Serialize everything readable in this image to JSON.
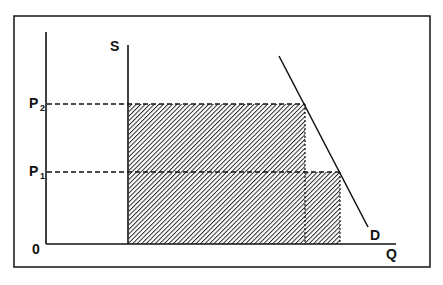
{
  "diagram": {
    "type": "supply-demand",
    "labels": {
      "supply": "S",
      "demand": "D",
      "quantity_axis": "Q",
      "origin": "0",
      "price_high": "P",
      "price_high_sub": "2",
      "price_low": "P",
      "price_low_sub": "1"
    },
    "colors": {
      "line": "#111111",
      "hatch": "#222222",
      "background": "#ffffff"
    }
  }
}
